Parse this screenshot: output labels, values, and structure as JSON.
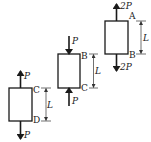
{
  "figure": {
    "blocks": [
      {
        "id": "block-1",
        "top_label": "C",
        "bottom_label": "D",
        "top_force": "P",
        "bottom_force": "P",
        "top_force_direction": "up",
        "bottom_force_direction": "down",
        "length_label": "L"
      },
      {
        "id": "block-2",
        "top_label": "B",
        "bottom_label": "C",
        "top_force": "P",
        "bottom_force": "P",
        "top_force_direction": "down",
        "bottom_force_direction": "up",
        "length_label": "L"
      },
      {
        "id": "block-3",
        "top_label": "A",
        "bottom_label": "B",
        "top_force": "2P",
        "bottom_force": "2P",
        "top_force_direction": "up",
        "bottom_force_direction": "down",
        "length_label": "L"
      }
    ]
  }
}
